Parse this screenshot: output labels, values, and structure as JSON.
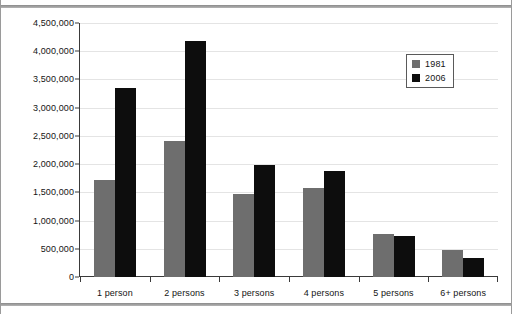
{
  "chart_data": {
    "type": "bar",
    "title": "",
    "xlabel": "",
    "ylabel": "",
    "categories": [
      "1 person",
      "2 persons",
      "3 persons",
      "4 persons",
      "5 persons",
      "6+ persons"
    ],
    "series": [
      {
        "name": "1981",
        "color": "#6e6e6e",
        "values": [
          1720000,
          2410000,
          1470000,
          1570000,
          770000,
          470000
        ]
      },
      {
        "name": "2006",
        "color": "#0d0d0d",
        "values": [
          3350000,
          4190000,
          1980000,
          1880000,
          730000,
          340000
        ]
      }
    ],
    "ylim": [
      0,
      4500000
    ],
    "ytick_step": 500000,
    "ytick_labels": [
      "4,500,000",
      "4,000,000",
      "3,500,000",
      "3,000,000",
      "2,500,000",
      "2,000,000",
      "1,500,000",
      "1,000,000",
      "500,000",
      "0"
    ],
    "ytick_values": [
      4500000,
      4000000,
      3500000,
      3000000,
      2500000,
      2000000,
      1500000,
      1000000,
      500000,
      0
    ],
    "grid": true,
    "legend_position": "top-right"
  },
  "legend": {
    "items": [
      {
        "label": "1981",
        "color": "#6e6e6e"
      },
      {
        "label": "2006",
        "color": "#0d0d0d"
      }
    ]
  }
}
